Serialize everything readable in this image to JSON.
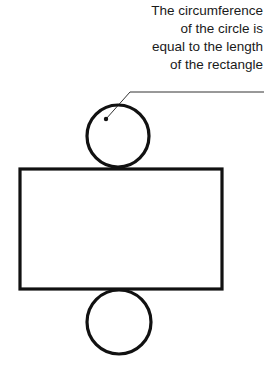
{
  "diagram": {
    "annotation": {
      "lines": [
        "The circumference",
        "of the circle is",
        "equal to the length",
        "of the rectangle"
      ]
    },
    "shapes": {
      "top_circle": {
        "cx": 118,
        "cy": 135,
        "r": 31
      },
      "rectangle": {
        "x": 20,
        "y": 169,
        "width": 202,
        "height": 120
      },
      "bottom_circle": {
        "cx": 119,
        "cy": 322,
        "r": 32
      },
      "leader": {
        "dot": [
          106,
          119
        ],
        "elbow": [
          130,
          92
        ],
        "end": [
          264,
          92
        ]
      }
    },
    "colors": {
      "stroke": "#111111",
      "background": "#ffffff"
    }
  }
}
